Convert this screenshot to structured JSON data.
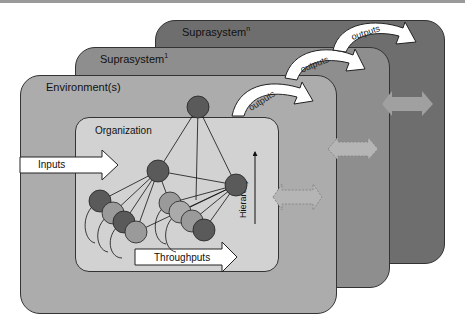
{
  "diagram": {
    "panels": {
      "suprasystem_n": {
        "label": "Suprasystem",
        "superscript": "n",
        "color": "#6e6e6e"
      },
      "suprasystem_1": {
        "label": "Suprasystem",
        "superscript": "1",
        "color": "#8e8e8e"
      },
      "environment": {
        "label": "Environment(s)",
        "color": "#acacac"
      },
      "organization": {
        "label": "Organization",
        "color": "#d2d2d2"
      }
    },
    "arrows": {
      "inputs": "Inputs",
      "throughputs": "Throughputs",
      "hierarchy": "Hierarchy",
      "outputs": [
        "outputs",
        "outputs",
        "outputs"
      ]
    },
    "node_colors": {
      "dark": "#5a5a5a",
      "light": "#9a9a9a"
    }
  }
}
